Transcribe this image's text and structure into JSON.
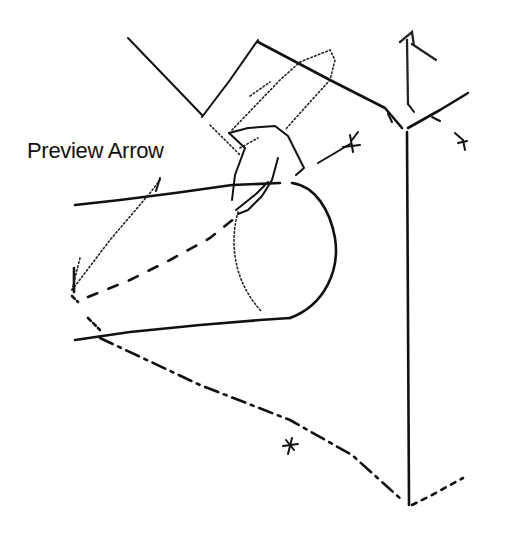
{
  "figure": {
    "callout": {
      "text": "Preview Arrow"
    },
    "colors": {
      "background": "#ffffff",
      "ink": "#111111"
    },
    "elements": [
      "cylinder",
      "cone-apex",
      "isometric-plane",
      "preview-arrow",
      "triad-axes",
      "dimension-ticks"
    ]
  }
}
